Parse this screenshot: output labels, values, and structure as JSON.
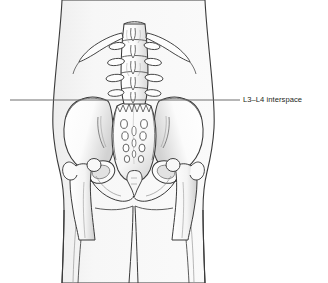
{
  "figure": {
    "name": "lumbar-spine-pelvis-posterior-view",
    "background_color": "#ffffff",
    "skin_fill_color": "#f7f7f7",
    "bone_fill_color": "#ffffff",
    "bone_shadow_color": "#d6d6d6",
    "outline_color": "#3a3a3a",
    "detail_line_color": "#6b6b6b"
  },
  "callout": {
    "label": "L3–L4 interspace",
    "line_color": "#6e6e6e",
    "line_y": 100,
    "line_start_x": 10,
    "line_end_x": 240,
    "text_color": "#231f20"
  },
  "anatomy": {
    "structures": [
      "torso-outline",
      "lumbar-vertebrae",
      "twelfth-ribs",
      "transverse-processes",
      "spinous-processes",
      "sacrum",
      "sacral-foramina",
      "coccyx",
      "left-ilium",
      "right-ilium",
      "left-femur",
      "right-femur",
      "gluteal-cleft"
    ],
    "sacral_foramina_pairs": 4,
    "lumbar_vertebrae_count": 5
  }
}
